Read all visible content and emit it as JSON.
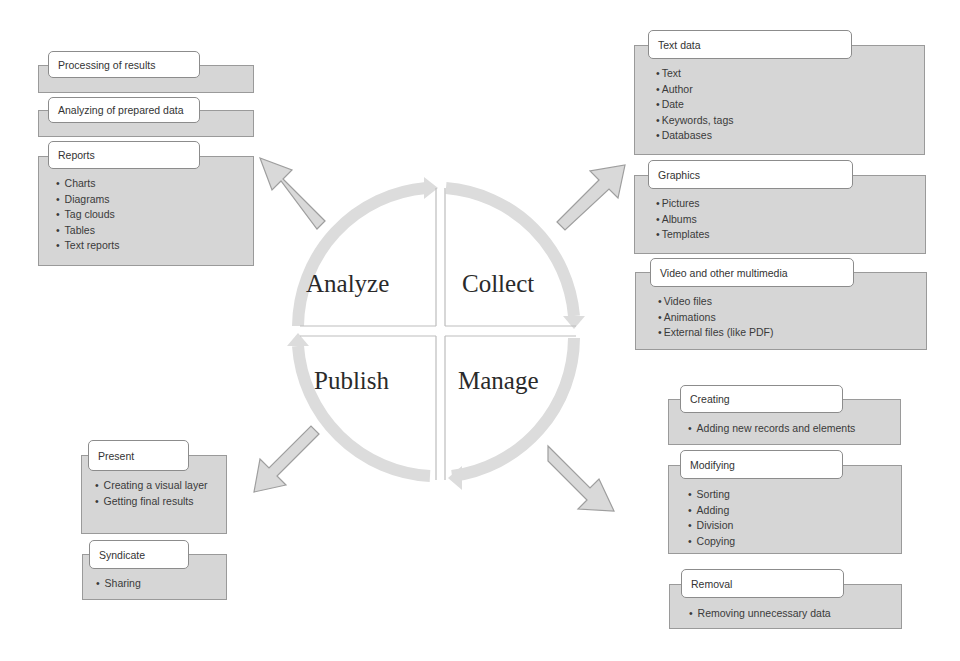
{
  "cycle": {
    "phases": [
      {
        "id": "analyze",
        "label": "Analyze"
      },
      {
        "id": "collect",
        "label": "Collect"
      },
      {
        "id": "publish",
        "label": "Publish"
      },
      {
        "id": "manage",
        "label": "Manage"
      }
    ]
  },
  "analyze_group": {
    "boxes": [
      {
        "title": "Processing of results",
        "items": []
      },
      {
        "title": "Analyzing of prepared data",
        "items": []
      },
      {
        "title": "Reports",
        "items": [
          "Charts",
          "Diagrams",
          "Tag clouds",
          "Tables",
          "Text reports"
        ]
      }
    ]
  },
  "collect_group": {
    "boxes": [
      {
        "title": "Text data",
        "items": [
          "Text",
          "Author",
          "Date",
          "Keywords, tags",
          "Databases"
        ]
      },
      {
        "title": "Graphics",
        "items": [
          "Pictures",
          "Albums",
          "Templates"
        ]
      },
      {
        "title": "Video and other multimedia",
        "items": [
          "Video files",
          "Animations",
          "External files (like PDF)"
        ]
      }
    ]
  },
  "manage_group": {
    "boxes": [
      {
        "title": "Creating",
        "items": [
          "Adding new records and elements"
        ]
      },
      {
        "title": "Modifying",
        "items": [
          "Sorting",
          "Adding",
          "Division",
          "Copying"
        ]
      },
      {
        "title": "Removal",
        "items": [
          "Removing unnecessary data"
        ]
      }
    ]
  },
  "publish_group": {
    "boxes": [
      {
        "title": "Present",
        "items": [
          "Creating a visual layer",
          "Getting final results"
        ]
      },
      {
        "title": "Syndicate",
        "items": [
          "Sharing"
        ]
      }
    ]
  },
  "colors": {
    "panel_fill": "#d6d6d6",
    "panel_border": "#9a9a9a",
    "arrow_fill": "#d9d9d9",
    "arrow_stroke": "#9e9e9e",
    "cycle_ring": "#dcdcdc"
  }
}
